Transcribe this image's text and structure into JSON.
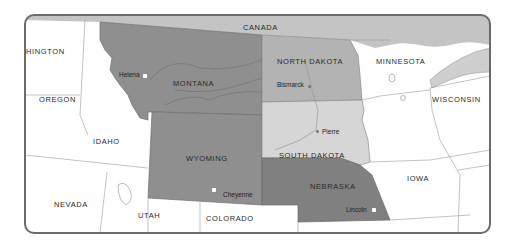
{
  "map": {
    "title": "Northern Great Plains States",
    "frame": {
      "x": 25,
      "y": 15,
      "width": 465,
      "height": 218,
      "border_color": "#6b6b6b"
    },
    "colors": {
      "montana": "#8f8f8f",
      "wyoming": "#8f8f8f",
      "nebraska": "#808080",
      "north_dakota": "#b3b3b3",
      "south_dakota": "#d6d6d6",
      "canada": "#c4c4c4",
      "lake_superior": "#cfcfcf",
      "other_states": "#ffffff",
      "boundary_line": "#9a9a9a"
    },
    "highlighted_states": [
      {
        "name": "MONTANA",
        "capital": "Helena"
      },
      {
        "name": "WYOMING",
        "capital": "Cheyenne"
      },
      {
        "name": "NORTH DAKOTA",
        "capital": "Bismarck"
      },
      {
        "name": "SOUTH DAKOTA",
        "capital": "Pierre"
      },
      {
        "name": "NEBRASKA",
        "capital": "Lincoln"
      }
    ],
    "labels": {
      "canada": "CANADA",
      "washington": "HINGTON",
      "oregon": "OREGON",
      "idaho": "IDAHO",
      "nevada": "NEVADA",
      "utah": "UTAH",
      "colorado": "COLORADO",
      "montana": "MONTANA",
      "wyoming": "WYOMING",
      "north_dakota": "NORTH DAKOTA",
      "south_dakota": "SOUTH DAKOTA",
      "nebraska": "NEBRASKA",
      "minnesota": "MINNESOTA",
      "wisconsin": "WISCONSIN",
      "iowa": "IOWA"
    },
    "cities": {
      "helena": "Helena",
      "bismarck": "Bismarck",
      "pierre": "Pierre",
      "cheyenne": "Cheyenne",
      "lincoln": "Lincoln"
    }
  }
}
